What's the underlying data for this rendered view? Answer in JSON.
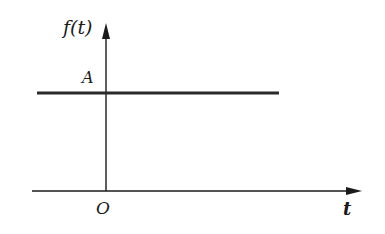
{
  "diagram": {
    "y_axis_label": "f(t)",
    "x_axis_label": "t",
    "origin_label": "O",
    "level_label": "A",
    "colors": {
      "axis": "#1a1a1a",
      "signal": "#2a2a2a",
      "background": "#ffffff"
    }
  }
}
